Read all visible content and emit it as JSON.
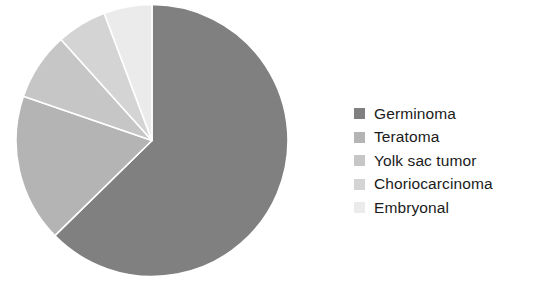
{
  "chart_data": {
    "type": "pie",
    "title": "",
    "subtitle": "",
    "xlabel": "",
    "ylabel": "",
    "grid": false,
    "legend_position": "right",
    "start_angle_deg": 0,
    "direction": "clockwise",
    "units": "percent",
    "categories": [
      "Germinoma",
      "Teratoma",
      "Yolk sac tumor",
      "Choriocarcinoma",
      "Embryonal"
    ],
    "values": [
      62.7,
      17.6,
      8.1,
      5.9,
      5.7
    ],
    "colors": [
      "#808080",
      "#b4b4b4",
      "#c6c6c6",
      "#d4d4d4",
      "#ebebeb"
    ],
    "slices": [
      {
        "label": "Germinoma",
        "value": 62.7,
        "color": "#808080",
        "start_angle_deg": 0.0,
        "end_angle_deg": 225.6
      },
      {
        "label": "Teratoma",
        "value": 17.6,
        "color": "#b4b4b4",
        "start_angle_deg": 225.6,
        "end_angle_deg": 289.0
      },
      {
        "label": "Yolk sac tumor",
        "value": 8.1,
        "color": "#c6c6c6",
        "start_angle_deg": 289.0,
        "end_angle_deg": 318.0
      },
      {
        "label": "Choriocarcinoma",
        "value": 5.9,
        "color": "#d4d4d4",
        "start_angle_deg": 318.0,
        "end_angle_deg": 339.4
      },
      {
        "label": "Embryonal",
        "value": 5.7,
        "color": "#ebebeb",
        "start_angle_deg": 339.4,
        "end_angle_deg": 360.0
      }
    ]
  },
  "legend": {
    "items": [
      {
        "label": "Germinoma",
        "color": "#808080"
      },
      {
        "label": "Teratoma",
        "color": "#b4b4b4"
      },
      {
        "label": "Yolk sac tumor",
        "color": "#c6c6c6"
      },
      {
        "label": "Choriocarcinoma",
        "color": "#d4d4d4"
      },
      {
        "label": "Embryonal",
        "color": "#ebebeb"
      }
    ]
  },
  "style": {
    "background": "#ffffff",
    "slice_separator": "#ffffff",
    "text_color": "#1b1b1b"
  }
}
